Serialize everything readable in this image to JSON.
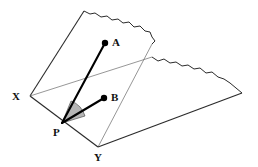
{
  "figure": {
    "background_color": "#ffffff",
    "line_color": "#2b2b2b",
    "thin_line_color": "#555555",
    "ray_color": "#000000",
    "angle_fill_color": "#b5b5b5",
    "point_fill_color": "#000000"
  },
  "labels": {
    "point_a": "A",
    "point_b": "B",
    "vertex_p": "P",
    "vertex_x": "X",
    "vertex_y": "Y"
  },
  "geometry": {
    "points": {
      "A": {
        "x": 105,
        "y": 43
      },
      "B": {
        "x": 104,
        "y": 98
      },
      "P": {
        "x": 62,
        "y": 123
      },
      "X": {
        "x": 30,
        "y": 96
      },
      "Y": {
        "x": 98,
        "y": 147
      }
    },
    "label_positions": {
      "A": {
        "x": 112,
        "y": 46
      },
      "B": {
        "x": 111,
        "y": 101
      },
      "P": {
        "x": 53,
        "y": 136
      },
      "X": {
        "x": 12,
        "y": 100
      },
      "Y": {
        "x": 94,
        "y": 161
      }
    },
    "tilted_plane_outline": [
      {
        "x": 30,
        "y": 96
      },
      {
        "x": 84,
        "y": 11
      },
      {
        "x": 152,
        "y": 44
      },
      {
        "x": 98,
        "y": 147
      }
    ],
    "horizontal_plane_outline": [
      {
        "x": 30,
        "y": 96
      },
      {
        "x": 152,
        "y": 57
      },
      {
        "x": 242,
        "y": 93
      },
      {
        "x": 98,
        "y": 147
      }
    ],
    "fold_line": {
      "from": {
        "x": 30,
        "y": 96
      },
      "to": {
        "x": 152,
        "y": 57
      }
    },
    "rays": [
      {
        "name": "PA",
        "from": "P",
        "to": "A"
      },
      {
        "name": "PB",
        "from": "P",
        "to": "B"
      }
    ],
    "angle_marker": {
      "vertex": "P",
      "radius": 23,
      "between": [
        "PA",
        "PB"
      ]
    }
  }
}
